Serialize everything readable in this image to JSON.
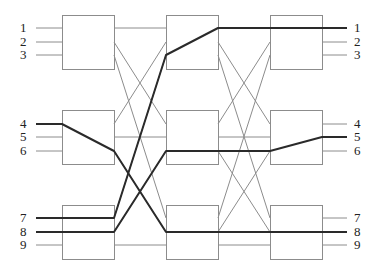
{
  "diagram": {
    "type": "three-stage-clos-switching-network",
    "stages": 3,
    "switches_per_stage": 3,
    "ports_per_switch": 3,
    "colors": {
      "box_stroke": "#8c8c8c",
      "wire": "#8c8c8c",
      "highlight": "#2a2a2a",
      "label": "#222222"
    },
    "columns": [
      {
        "x": 62,
        "width": 52
      },
      {
        "x": 166,
        "width": 52
      },
      {
        "x": 270,
        "width": 52
      }
    ],
    "rows": [
      {
        "y": 15,
        "height": 54,
        "ports": [
          28,
          42,
          55
        ]
      },
      {
        "y": 110,
        "height": 54,
        "ports": [
          124,
          137,
          151
        ]
      },
      {
        "y": 205,
        "height": 54,
        "ports": [
          218,
          232,
          245
        ]
      }
    ],
    "input_labels": [
      {
        "text": "1",
        "y": 28
      },
      {
        "text": "2",
        "y": 42
      },
      {
        "text": "3",
        "y": 55
      },
      {
        "text": "4",
        "y": 124
      },
      {
        "text": "5",
        "y": 137
      },
      {
        "text": "6",
        "y": 151
      },
      {
        "text": "7",
        "y": 218
      },
      {
        "text": "8",
        "y": 232
      },
      {
        "text": "9",
        "y": 245
      }
    ],
    "output_labels": [
      {
        "text": "1",
        "y": 28
      },
      {
        "text": "2",
        "y": 42
      },
      {
        "text": "3",
        "y": 55
      },
      {
        "text": "4",
        "y": 124
      },
      {
        "text": "5",
        "y": 137
      },
      {
        "text": "6",
        "y": 151
      },
      {
        "text": "7",
        "y": 218
      },
      {
        "text": "8",
        "y": 232
      },
      {
        "text": "9",
        "y": 245
      }
    ],
    "highlighted_paths": [
      {
        "name": "path-input4-to-output8",
        "from_input": "4",
        "to_output": "8",
        "points": [
          [
            36,
            124
          ],
          [
            62,
            124
          ],
          [
            114,
            151
          ],
          [
            166,
            232
          ],
          [
            218,
            232
          ],
          [
            270,
            232
          ],
          [
            322,
            232
          ],
          [
            347,
            232
          ]
        ]
      },
      {
        "name": "path-input7-to-output1",
        "from_input": "7",
        "to_output": "1",
        "points": [
          [
            36,
            218
          ],
          [
            114,
            218
          ],
          [
            166,
            55
          ],
          [
            218,
            28
          ],
          [
            270,
            28
          ],
          [
            322,
            28
          ],
          [
            347,
            28
          ]
        ]
      },
      {
        "name": "path-input8-to-output5",
        "from_input": "8",
        "to_output": "5",
        "points": [
          [
            36,
            232
          ],
          [
            114,
            232
          ],
          [
            166,
            151
          ],
          [
            218,
            151
          ],
          [
            270,
            151
          ],
          [
            322,
            137
          ],
          [
            347,
            137
          ]
        ]
      }
    ]
  }
}
